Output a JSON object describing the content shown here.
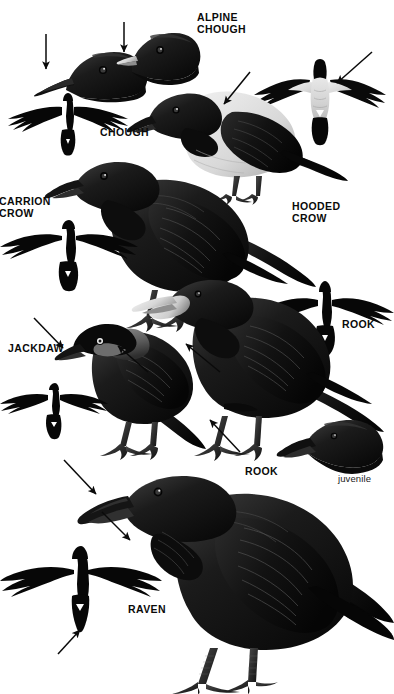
{
  "plate": {
    "title": "Crow family identification plate",
    "background_color": "#ffffff",
    "ink_color": "#0a0a0a",
    "width": 394,
    "height": 694
  },
  "labels": [
    {
      "id": "alpine-chough",
      "text": "ALPINE\nCHOUGH",
      "style": "caps-bold"
    },
    {
      "id": "chough",
      "text": "CHOUGH",
      "style": "caps-bold"
    },
    {
      "id": "carrion-crow",
      "text": "CARRION\nCROW",
      "style": "caps-bold"
    },
    {
      "id": "hooded-crow",
      "text": "HOODED\nCROW",
      "style": "caps-bold"
    },
    {
      "id": "rook-flight",
      "text": "ROOK",
      "style": "caps-bold"
    },
    {
      "id": "jackdaw",
      "text": "JACKDAW",
      "style": "caps-bold"
    },
    {
      "id": "rook-perched",
      "text": "ROOK",
      "style": "caps-bold"
    },
    {
      "id": "juvenile",
      "text": "juvenile",
      "style": "lowercase-plain"
    },
    {
      "id": "raven",
      "text": "RAVEN",
      "style": "caps-bold"
    }
  ],
  "figures": [
    {
      "id": "chough-head",
      "species": "Chough",
      "pose": "head profile",
      "note": "long curved red bill"
    },
    {
      "id": "alpine-chough-head",
      "species": "Alpine Chough",
      "pose": "head profile",
      "note": "short pale yellow bill"
    },
    {
      "id": "chough-flight",
      "species": "Chough",
      "pose": "flight silhouette from below"
    },
    {
      "id": "hooded-crow-flight",
      "species": "Hooded Crow",
      "pose": "flight from below",
      "note": "pale grey body, black wings"
    },
    {
      "id": "hooded-crow-perched",
      "species": "Hooded Crow",
      "pose": "perched",
      "note": "grey mantle and underparts"
    },
    {
      "id": "carrion-crow-perched",
      "species": "Carrion Crow",
      "pose": "perched"
    },
    {
      "id": "carrion-crow-flight",
      "species": "Carrion Crow",
      "pose": "flight silhouette from below"
    },
    {
      "id": "jackdaw-perched",
      "species": "Jackdaw",
      "pose": "perched",
      "note": "grey nape, pale eye"
    },
    {
      "id": "jackdaw-flight",
      "species": "Jackdaw",
      "pose": "flight silhouette from below"
    },
    {
      "id": "rook-perched",
      "species": "Rook",
      "pose": "perched",
      "note": "bare whitish face at bill base"
    },
    {
      "id": "rook-flight",
      "species": "Rook",
      "pose": "flight silhouette from below"
    },
    {
      "id": "rook-juvenile-head",
      "species": "Rook",
      "pose": "juvenile head profile",
      "note": "feathered face"
    },
    {
      "id": "raven-perched",
      "species": "Raven",
      "pose": "perched",
      "note": "heavy bill, shaggy throat"
    },
    {
      "id": "raven-flight",
      "species": "Raven",
      "pose": "flight silhouette from below",
      "note": "wedge-shaped tail"
    }
  ],
  "pointers": [
    {
      "id": "arrow-chough-bill",
      "direction": "down",
      "target": "Chough bill"
    },
    {
      "id": "arrow-alpine-chough-bill",
      "direction": "down",
      "target": "Alpine Chough bill"
    },
    {
      "id": "arrow-hooded-crow-flight",
      "direction": "down-left",
      "target": "Hooded Crow grey underbody"
    },
    {
      "id": "arrow-hooded-crow-back",
      "direction": "down-left",
      "target": "Hooded Crow grey mantle"
    },
    {
      "id": "arrow-jackdaw-bill",
      "direction": "down-right",
      "target": "Jackdaw short bill"
    },
    {
      "id": "arrow-jackdaw-nape",
      "direction": "up-right",
      "target": "Jackdaw grey nape"
    },
    {
      "id": "arrow-rook-face",
      "direction": "up-right",
      "target": "Rook bare face patch"
    },
    {
      "id": "arrow-rook-belly",
      "direction": "up-right",
      "target": "Rook loose thigh feathering"
    },
    {
      "id": "arrow-raven-bill",
      "direction": "down-right",
      "target": "Raven heavy bill"
    },
    {
      "id": "arrow-raven-throat",
      "direction": "down-right",
      "target": "Raven shaggy throat hackles"
    },
    {
      "id": "arrow-raven-tail",
      "direction": "up-right",
      "target": "Raven wedge-shaped tail"
    }
  ]
}
